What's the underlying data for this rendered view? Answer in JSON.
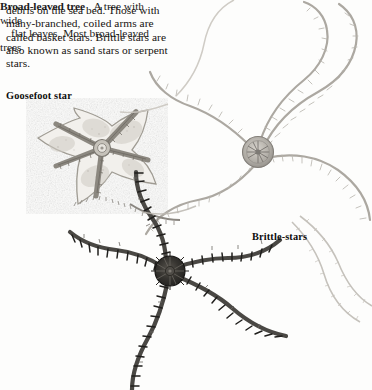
{
  "page": {
    "width": 372,
    "height": 390,
    "background_color": "#fdfdfc",
    "ink_color": "#15120f"
  },
  "top_text": {
    "lines": [
      "debris on the sea bed. Those with",
      "many-branched, coiled arms are",
      "called basket stars. Brittle stars are",
      "also known as sand stars or serpent",
      "stars."
    ],
    "full_text": "debris on the sea bed. Those with many-branched, coiled arms are called basket stars. Brittle stars are also known as sand stars or serpent stars."
  },
  "captions": {
    "goosefoot": "Goosefoot star",
    "brittle": "Brittle-stars"
  },
  "bottom_entry": {
    "term": "Broad-leaved tree",
    "definition_line_1": "A tree with wide",
    "definition_line_2": "flat leaves. Most broad-leaved trees",
    "definition_full": "A tree with wide flat leaves. Most broad-leaved trees"
  },
  "illustration": {
    "description": "Engraved natural-history plate of echinoderms",
    "subjects": [
      {
        "name": "goosefoot-star",
        "arms": 5,
        "tone": "#9a968f",
        "note": "webbed five-pointed star, lower left"
      },
      {
        "name": "brittle-star-upper",
        "arms": 5,
        "tone": "#8d8a85",
        "note": "round central disc with long spiny curling arms, upper right"
      },
      {
        "name": "brittle-star-lower",
        "arms": 5,
        "tone": "#3a3936",
        "note": "dark disc with segmented radiating arms, lower centre"
      }
    ],
    "palette": {
      "light_arm": "#b9b6b0",
      "mid_arm": "#8d8a85",
      "dark_arm": "#4a4844",
      "disc_dark": "#2f2e2b",
      "disc_light": "#a7a39c"
    }
  }
}
